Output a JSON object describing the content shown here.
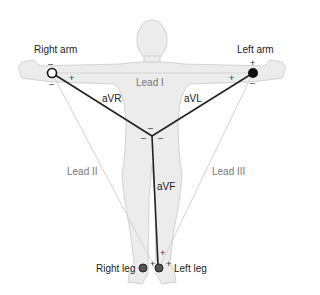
{
  "diagram": {
    "type": "ECG limb lead diagram (Einthoven triangle with augmented leads)",
    "electrodes": {
      "right_arm": "Right arm",
      "left_arm": "Left arm",
      "right_leg": "Right leg",
      "left_leg": "Left leg"
    },
    "leads": {
      "lead1": "Lead I",
      "lead2": "Lead II",
      "lead3": "Lead III",
      "avr": "aVR",
      "avl": "aVL",
      "avf": "aVF"
    },
    "signs": {
      "plus": "+",
      "minus": "–"
    },
    "colors": {
      "body_fill": "#eeeeee",
      "body_stroke": "#c8c8c8",
      "augmented_line": "#222222",
      "bipolar_line": "#d0d0d0",
      "electrode_dark": "#111111",
      "leg_electrode": "#555555"
    }
  }
}
